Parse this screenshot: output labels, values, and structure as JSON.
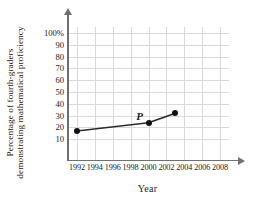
{
  "chart_data": {
    "type": "line",
    "title": "",
    "xlabel": "Year",
    "ylabel_lines": [
      "Percentage of fourth-graders",
      "demonstrating mathematical proficiency"
    ],
    "x": [
      1992,
      2000,
      2003
    ],
    "values": [
      17,
      24,
      32
    ],
    "point_labels": [
      "",
      "P",
      ""
    ],
    "xlim": [
      1991,
      2009
    ],
    "ylim": [
      0,
      105
    ],
    "xticks": [
      "1992",
      "1994",
      "1996",
      "1998",
      "2000",
      "2002",
      "2004",
      "2006",
      "2008"
    ],
    "xtick_values": [
      1992,
      1994,
      1996,
      1998,
      2000,
      2002,
      2004,
      2006,
      2008
    ],
    "yticks": [
      "100%",
      "90",
      "80",
      "70",
      "60",
      "50",
      "40",
      "30",
      "20",
      "10"
    ],
    "ytick_values": [
      100,
      90,
      80,
      70,
      60,
      50,
      40,
      30,
      20,
      10
    ],
    "grid": true,
    "legend": "none",
    "line_color": "#2b2b2b",
    "marker_color": "#111111",
    "grid_color": "#d9d9d9",
    "axis_color": "#6f6f6f",
    "annotations": [
      {
        "text": "P",
        "x": 2000,
        "y": 30
      }
    ]
  },
  "axes": {
    "x_title": "Year",
    "y_title_line1": "Percentage of fourth-graders",
    "y_title_line2": "demonstrating mathematical proficiency"
  }
}
